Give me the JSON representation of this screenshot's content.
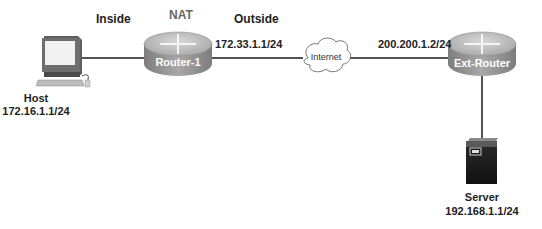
{
  "diagram": {
    "type": "network-topology",
    "zones": {
      "inside": "Inside",
      "nat": "NAT",
      "outside": "Outside"
    },
    "nodes": [
      {
        "id": "host",
        "kind": "pc",
        "name": "Host",
        "ip": "172.16.1.1/24"
      },
      {
        "id": "router1",
        "kind": "router",
        "name": "Router-1"
      },
      {
        "id": "internet",
        "kind": "cloud",
        "name": "Internet"
      },
      {
        "id": "extrouter",
        "kind": "router",
        "name": "Ext-Router"
      },
      {
        "id": "server",
        "kind": "server",
        "name": "Server",
        "ip": "192.168.1.1/24"
      }
    ],
    "links": [
      {
        "from": "host",
        "to": "router1"
      },
      {
        "from": "router1",
        "to": "internet",
        "label": "172.33.1.1/24"
      },
      {
        "from": "internet",
        "to": "extrouter",
        "label": "200.200.1.2/24"
      },
      {
        "from": "extrouter",
        "to": "server"
      }
    ],
    "colors": {
      "line": "#1a1a1a",
      "router_body": "#9a9a9a",
      "router_top": "#c4c4c4",
      "server_body": "#1e1e1e",
      "nat_label": "#666666"
    }
  }
}
